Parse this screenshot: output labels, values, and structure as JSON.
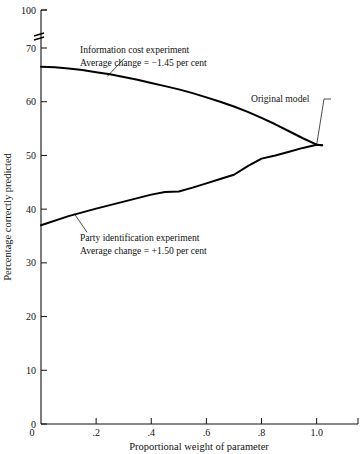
{
  "chart_data": {
    "type": "line",
    "title": "",
    "xlabel": "Proportional weight of parameter",
    "ylabel": "Percentage correctly predicted",
    "xlim": [
      0,
      1.15
    ],
    "ylim": [
      0,
      100
    ],
    "grid": false,
    "legend_position": "inline-annotations",
    "axis_break": {
      "present": true,
      "between": [
        70,
        100
      ],
      "axis": "y"
    },
    "xticks": [
      0,
      0.2,
      0.4,
      0.6,
      0.8,
      1.0
    ],
    "xticklabels": [
      "0",
      ".2",
      ".4",
      ".6",
      ".8",
      "1.0"
    ],
    "yticks": [
      0,
      10,
      20,
      30,
      40,
      50,
      60,
      70,
      100
    ],
    "yticklabels": [
      "0",
      "10",
      "20",
      "30",
      "40",
      "50",
      "60",
      "70",
      "100"
    ],
    "series": [
      {
        "name": "Information cost experiment",
        "x": [
          0.0,
          0.05,
          0.1,
          0.15,
          0.2,
          0.25,
          0.3,
          0.35,
          0.4,
          0.45,
          0.5,
          0.55,
          0.6,
          0.65,
          0.7,
          0.75,
          0.8,
          0.85,
          0.9,
          0.95,
          1.0,
          1.02
        ],
        "values": [
          66.5,
          66.4,
          66.2,
          65.9,
          65.5,
          65.1,
          64.6,
          64.1,
          63.5,
          62.9,
          62.3,
          61.6,
          60.8,
          60.0,
          59.1,
          58.1,
          57.0,
          55.8,
          54.5,
          53.2,
          52.0,
          51.9
        ]
      },
      {
        "name": "Party identification experiment",
        "x": [
          0.0,
          0.1,
          0.2,
          0.3,
          0.4,
          0.45,
          0.5,
          0.55,
          0.6,
          0.65,
          0.7,
          0.75,
          0.8,
          0.85,
          0.9,
          0.95,
          1.0,
          1.02
        ],
        "values": [
          37.0,
          38.7,
          40.1,
          41.4,
          42.7,
          43.2,
          43.3,
          44.0,
          44.8,
          45.6,
          46.4,
          48.0,
          49.4,
          50.0,
          50.7,
          51.4,
          52.0,
          51.9
        ]
      }
    ],
    "annotations": [
      {
        "id": "information-cost",
        "line1": "Information cost experiment",
        "line2": "Average change  =  −1.45 per cent",
        "points_to": {
          "x": 0.24,
          "y": 64.7
        }
      },
      {
        "id": "party-identification",
        "line1": "Party identification experiment",
        "line2": "Average change  =  +1.50 per cent",
        "points_to": {
          "x": 0.12,
          "y": 39.2
        }
      },
      {
        "id": "original-model",
        "line1": "Original model",
        "points_to": {
          "x": 1.0,
          "y": 52.0
        }
      }
    ]
  }
}
